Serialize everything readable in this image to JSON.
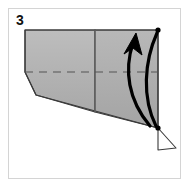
{
  "figure": {
    "kind": "origami-step-diagram",
    "step_number": "3",
    "caption": "",
    "frame": {
      "x": 8,
      "y": 8,
      "width": 173,
      "height": 171,
      "border_color": "#d4d4d4",
      "background_color": "#ffffff"
    }
  },
  "colors": {
    "paper_fill": "#b3b3b3",
    "paper_fill_light": "#c4c4c4",
    "paper_edge": "#3a3a3a",
    "fold_line": "#6e6e6e",
    "crease_dashed": "#555555",
    "arrow": "#000000",
    "vertex_dot": "#000000",
    "flap_fill": "#ffffff",
    "page_background": "#ffffff",
    "label_text": "#111111"
  },
  "geometry": {
    "paper_outline_points": "25,30 158,30 158,128 36,95 25,72",
    "left_panel_points": "25,30 95,30 95,112 36,95 25,72",
    "right_panel_points": "95,30 158,30 158,128 95,112",
    "vertical_fold": {
      "x1": 95,
      "y1": 30,
      "x2": 95,
      "y2": 112
    },
    "dashed_crease": {
      "x1": 25,
      "y1": 72,
      "x2": 158,
      "y2": 72
    },
    "flap_points": "158,128 176,148 158,150",
    "top_vertex": {
      "x": 158,
      "y": 30
    },
    "bottom_vertex": {
      "x": 158,
      "y": 128
    }
  },
  "annotations": {
    "arrows": [
      {
        "name": "fold-arrow-primary",
        "meaning": "valley-fold-up",
        "path": "M 150,126 C 128,100 124,70 133,43",
        "has_arrowhead": true,
        "arrowhead_points": "133,34 142,52 133,47 123,52",
        "stroke_width": 3.2
      },
      {
        "name": "fold-arrow-secondary",
        "meaning": "return-swing",
        "path": "M 156,126 C 142,98 144,62 157,33",
        "has_arrowhead": false,
        "stroke_width": 3.2
      }
    ],
    "vertex_dots": [
      {
        "name": "vertex-dot-top-right",
        "x": 158,
        "y": 30,
        "r": 2.6
      },
      {
        "name": "vertex-dot-bottom-right",
        "x": 158,
        "y": 128,
        "r": 2.6
      }
    ]
  }
}
